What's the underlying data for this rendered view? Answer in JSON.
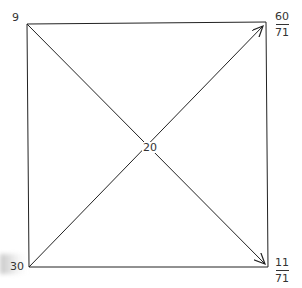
{
  "diagram": {
    "type": "square-with-crossing-diagonal-arrows",
    "colors": {
      "line": "#222222",
      "text": "#333333",
      "background": "#ffffff"
    },
    "corners": {
      "top_left": {
        "label": "9"
      },
      "top_right": {
        "numerator": "60",
        "denominator": "71"
      },
      "bottom_right": {
        "numerator": "11",
        "denominator": "71"
      },
      "bottom_left": {
        "label": "30"
      }
    },
    "center": {
      "label": "20"
    },
    "arrows": [
      {
        "from": "top_left",
        "to": "bottom_right"
      },
      {
        "from": "bottom_left",
        "to": "top_right"
      }
    ]
  }
}
